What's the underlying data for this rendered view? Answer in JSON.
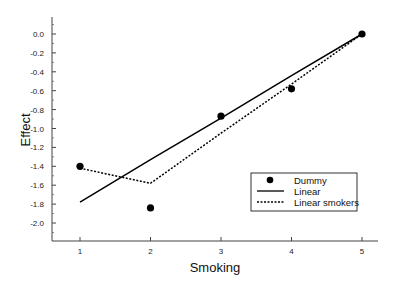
{
  "chart_data": {
    "type": "line",
    "title": "",
    "xlabel": "Smoking",
    "ylabel": "Effect",
    "xlim": [
      0.6,
      5.23
    ],
    "ylim": [
      -2.19,
      0.18
    ],
    "x_ticks": [
      1,
      2,
      3,
      4,
      5
    ],
    "x_tick_labels": [
      "1",
      "2",
      "3",
      "4",
      "5"
    ],
    "y_ticks": [
      0.0,
      -0.2,
      -0.4,
      -0.6,
      -0.8,
      -1.0,
      -1.2,
      -1.4,
      -1.6,
      -1.8,
      -2.0
    ],
    "y_tick_labels": [
      "0.0",
      "-0.2",
      "-0.4",
      "-0.6",
      "-0.8",
      "-1.0",
      "-1.2",
      "-1.4",
      "-1.6",
      "-1.8",
      "-2.0"
    ],
    "grid": false,
    "legend_position": "lower right",
    "x": [
      1,
      2,
      3,
      4,
      5
    ],
    "series": [
      {
        "name": "Dummy",
        "style": "scatter",
        "marker": "filled-circle",
        "color": "#000000",
        "values": [
          -1.4,
          -1.84,
          -0.87,
          -0.58,
          0.0
        ]
      },
      {
        "name": "Linear",
        "style": "solid-line",
        "color": "#000000",
        "values": [
          -1.78,
          -1.33,
          -0.89,
          -0.44,
          0.0
        ]
      },
      {
        "name": "Linear smokers",
        "style": "dotted-line",
        "color": "#000000",
        "values": [
          -1.42,
          -1.58,
          -1.05,
          -0.53,
          0.0
        ]
      }
    ]
  },
  "legend": {
    "items": [
      {
        "label": "Dummy"
      },
      {
        "label": "Linear"
      },
      {
        "label": "Linear smokers"
      }
    ]
  },
  "axes": {
    "xlabel": "Smoking",
    "ylabel": "Effect"
  }
}
